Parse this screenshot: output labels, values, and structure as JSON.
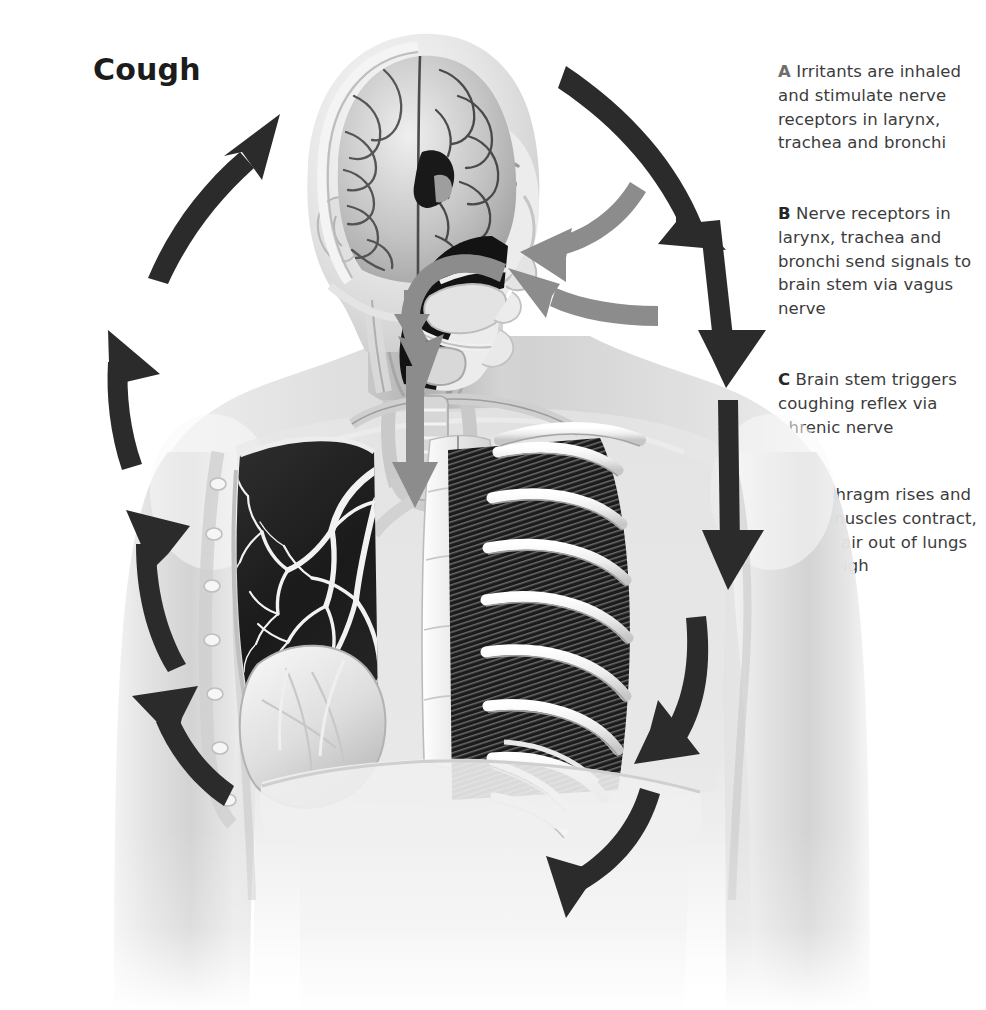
{
  "figure": {
    "title": "Cough",
    "background_color": "#ffffff",
    "arrow_color_primary": "#2b2b2b",
    "arrow_color_secondary": "#8c8c8c",
    "text_color": "#3c3c3c",
    "title_color": "#1c1c1c"
  },
  "captions": [
    {
      "label": "A",
      "label_color": "#6e6e6e",
      "text": "Irritants are inhaled and stimulate nerve receptors in larynx, trachea and bronchi"
    },
    {
      "label": "B",
      "label_color": "#252525",
      "text": "Nerve receptors in larynx, trachea and bronchi send signals to brain stem via vagus nerve"
    },
    {
      "label": "C",
      "label_color": "#252525",
      "text": "Brain stem triggers coughing reflex via phrenic nerve"
    },
    {
      "label": "D",
      "label_color": "#e2e2e2",
      "text": "Diaphragm rises and chest muscles contract, forcing air out of lungs as a cough"
    }
  ],
  "anatomy_parts": [
    "head-sagittal-section",
    "brain-cerebrum",
    "nasal-cavity",
    "oral-cavity-tongue",
    "larynx",
    "trachea",
    "left-lung-bronchial-tree",
    "heart",
    "rib-cage",
    "intercostal-muscles",
    "diaphragm",
    "shoulder-torso-arms"
  ],
  "arrows": {
    "cycle_black": [
      {
        "name": "arrow-top-right-inhale",
        "direction": "down-right"
      },
      {
        "name": "arrow-right-upper-descend",
        "direction": "down"
      },
      {
        "name": "arrow-right-lower-descend",
        "direction": "down-left"
      },
      {
        "name": "arrow-bottom-right-sweep",
        "direction": "left"
      },
      {
        "name": "arrow-left-lower-rise",
        "direction": "up-left"
      },
      {
        "name": "arrow-left-mid-rise",
        "direction": "up"
      },
      {
        "name": "arrow-left-upper-rise",
        "direction": "up"
      },
      {
        "name": "arrow-left-top-rise",
        "direction": "up-right"
      }
    ],
    "gray_signal": [
      {
        "name": "arrow-gray-upper-to-face",
        "direction": "left"
      },
      {
        "name": "arrow-gray-lower-to-face",
        "direction": "left"
      },
      {
        "name": "arrow-gray-throat-short",
        "direction": "down"
      },
      {
        "name": "arrow-gray-trachea-long",
        "direction": "down"
      },
      {
        "name": "arrow-gray-oral-loop",
        "direction": "loop"
      }
    ]
  }
}
